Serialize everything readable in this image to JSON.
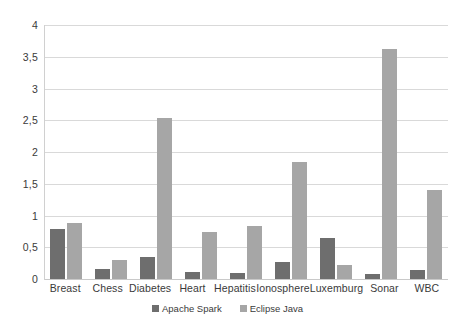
{
  "chart_data": {
    "type": "bar",
    "title": "",
    "subtitle": "",
    "xlabel": "",
    "ylabel": "",
    "categories": [
      "Breast",
      "Chess",
      "Diabetes",
      "Heart",
      "Hepatitis",
      "Ionosphere",
      "Luxemburg",
      "Sonar",
      "WBC"
    ],
    "series": [
      {
        "name": "Apache Spark",
        "color": "#6e6e6e",
        "values": [
          0.79,
          0.16,
          0.34,
          0.11,
          0.1,
          0.27,
          0.64,
          0.08,
          0.14
        ]
      },
      {
        "name": "Eclipse Java",
        "color": "#a6a6a6",
        "values": [
          0.88,
          0.3,
          2.54,
          0.74,
          0.84,
          1.84,
          0.22,
          3.63,
          1.4
        ]
      }
    ],
    "ylim": [
      0,
      4
    ],
    "ytick_values": [
      0,
      0.5,
      1,
      1.5,
      2,
      2.5,
      3,
      3.5,
      4
    ],
    "ytick_labels": [
      "0",
      "0,5",
      "1",
      "1,5",
      "2",
      "2,5",
      "3",
      "3,5",
      "4"
    ],
    "grid": true,
    "grid_axis": "y",
    "legend_position": "bottom",
    "decimal_separator": ","
  },
  "colors": {
    "background": "#ffffff",
    "gridline": "#d9d9d9",
    "axis": "#d0d0d0",
    "text": "#3a3a3a",
    "series_apache_spark": "#6e6e6e",
    "series_eclipse_java": "#a6a6a6"
  }
}
